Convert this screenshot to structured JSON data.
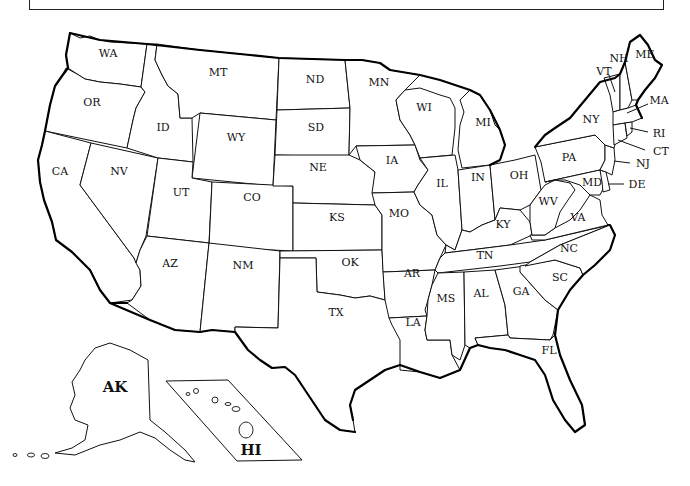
{
  "title": "",
  "map": {
    "type": "outline-map",
    "region": "United States",
    "states": [
      {
        "abbr": "WA",
        "name": "Washington"
      },
      {
        "abbr": "OR",
        "name": "Oregon"
      },
      {
        "abbr": "CA",
        "name": "California"
      },
      {
        "abbr": "NV",
        "name": "Nevada"
      },
      {
        "abbr": "ID",
        "name": "Idaho"
      },
      {
        "abbr": "MT",
        "name": "Montana"
      },
      {
        "abbr": "WY",
        "name": "Wyoming"
      },
      {
        "abbr": "UT",
        "name": "Utah"
      },
      {
        "abbr": "CO",
        "name": "Colorado"
      },
      {
        "abbr": "AZ",
        "name": "Arizona"
      },
      {
        "abbr": "NM",
        "name": "New Mexico"
      },
      {
        "abbr": "ND",
        "name": "North Dakota"
      },
      {
        "abbr": "SD",
        "name": "South Dakota"
      },
      {
        "abbr": "NE",
        "name": "Nebraska"
      },
      {
        "abbr": "KS",
        "name": "Kansas"
      },
      {
        "abbr": "OK",
        "name": "Oklahoma"
      },
      {
        "abbr": "TX",
        "name": "Texas"
      },
      {
        "abbr": "MN",
        "name": "Minnesota"
      },
      {
        "abbr": "IA",
        "name": "Iowa"
      },
      {
        "abbr": "MO",
        "name": "Missouri"
      },
      {
        "abbr": "AR",
        "name": "Arkansas"
      },
      {
        "abbr": "LA",
        "name": "Louisiana"
      },
      {
        "abbr": "WI",
        "name": "Wisconsin"
      },
      {
        "abbr": "IL",
        "name": "Illinois"
      },
      {
        "abbr": "MI",
        "name": "Michigan"
      },
      {
        "abbr": "IN",
        "name": "Indiana"
      },
      {
        "abbr": "OH",
        "name": "Ohio"
      },
      {
        "abbr": "KY",
        "name": "Kentucky"
      },
      {
        "abbr": "TN",
        "name": "Tennessee"
      },
      {
        "abbr": "MS",
        "name": "Mississippi"
      },
      {
        "abbr": "AL",
        "name": "Alabama"
      },
      {
        "abbr": "GA",
        "name": "Georgia"
      },
      {
        "abbr": "FL",
        "name": "Florida"
      },
      {
        "abbr": "SC",
        "name": "South Carolina"
      },
      {
        "abbr": "NC",
        "name": "North Carolina"
      },
      {
        "abbr": "VA",
        "name": "Virginia"
      },
      {
        "abbr": "WV",
        "name": "West Virginia"
      },
      {
        "abbr": "PA",
        "name": "Pennsylvania"
      },
      {
        "abbr": "NY",
        "name": "New York"
      },
      {
        "abbr": "MD",
        "name": "Maryland"
      },
      {
        "abbr": "DE",
        "name": "Delaware"
      },
      {
        "abbr": "NJ",
        "name": "New Jersey"
      },
      {
        "abbr": "CT",
        "name": "Connecticut"
      },
      {
        "abbr": "RI",
        "name": "Rhode Island"
      },
      {
        "abbr": "MA",
        "name": "Massachusetts"
      },
      {
        "abbr": "VT",
        "name": "Vermont"
      },
      {
        "abbr": "NH",
        "name": "New Hampshire"
      },
      {
        "abbr": "ME",
        "name": "Maine"
      },
      {
        "abbr": "AK",
        "name": "Alaska"
      },
      {
        "abbr": "HI",
        "name": "Hawaii"
      }
    ],
    "labels": {
      "WA": "WA",
      "OR": "OR",
      "CA": "CA",
      "NV": "NV",
      "ID": "ID",
      "MT": "MT",
      "WY": "WY",
      "UT": "UT",
      "CO": "CO",
      "AZ": "AZ",
      "NM": "NM",
      "ND": "ND",
      "SD": "SD",
      "NE": "NE",
      "KS": "KS",
      "OK": "OK",
      "TX": "TX",
      "MN": "MN",
      "IA": "IA",
      "MO": "MO",
      "AR": "AR",
      "LA": "LA",
      "WI": "WI",
      "IL": "IL",
      "MI": "MI",
      "IN": "IN",
      "OH": "OH",
      "KY": "KY",
      "TN": "TN",
      "MS": "MS",
      "AL": "AL",
      "GA": "GA",
      "FL": "FL",
      "SC": "SC",
      "NC": "NC",
      "VA": "VA",
      "WV": "WV",
      "PA": "PA",
      "NY": "NY",
      "MD": "MD",
      "DE": "DE",
      "NJ": "NJ",
      "CT": "CT",
      "RI": "RI",
      "MA": "MA",
      "VT": "VT",
      "NH": "NH",
      "ME": "ME",
      "AK": "AK",
      "HI": "HI"
    },
    "colors": {
      "fill": "#ffffff",
      "border": "#111111",
      "coast": "#000000"
    }
  }
}
